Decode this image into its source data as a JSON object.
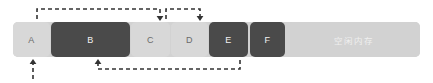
{
  "diagram": {
    "colors": {
      "bar_background": "#d2d2d2",
      "free_block": "#d2d2d2",
      "allocated_light": "#d8d8d8",
      "allocated_dark": "#4a4a4a",
      "arrow": "#333333",
      "page_background": "#ffffff",
      "label_on_light": "#6a6a6a",
      "label_on_dark": "#f2f2f2"
    },
    "bar": {
      "x": 13,
      "y": 22,
      "width": 407,
      "height": 35
    },
    "blocks": [
      {
        "label": "A",
        "x": 13,
        "width": 37,
        "style": "light",
        "name": "memory-block-a"
      },
      {
        "label": "B",
        "x": 51,
        "width": 79,
        "style": "dark",
        "name": "memory-block-b"
      },
      {
        "label": "C",
        "x": 131,
        "width": 39,
        "style": "light",
        "name": "memory-block-c"
      },
      {
        "label": "D",
        "x": 171,
        "width": 37,
        "style": "light",
        "name": "memory-block-d"
      },
      {
        "label": "E",
        "x": 209,
        "width": 39,
        "style": "dark",
        "name": "memory-block-e"
      },
      {
        "label": "F",
        "x": 250,
        "width": 35,
        "style": "dark",
        "name": "memory-block-f"
      },
      {
        "label": "空闲内存",
        "x": 287,
        "width": 133,
        "style": "free",
        "name": "memory-block-free"
      }
    ],
    "arrows": [
      {
        "name": "arrow-a-to-c",
        "path": "M 37 19 L 37 9 L 160 9 L 160 17",
        "head": {
          "x": 160,
          "y": 21,
          "dir": "down"
        }
      },
      {
        "name": "arrow-c-to-d",
        "path": "M 166 19 L 166 9 L 200 9 L 200 17",
        "head": {
          "x": 200,
          "y": 21,
          "dir": "down"
        }
      },
      {
        "name": "arrow-up-into-a",
        "path": "M 33 79 L 33 64",
        "head": {
          "x": 33,
          "y": 59,
          "dir": "up"
        }
      },
      {
        "name": "arrow-e-to-b",
        "path": "M 240 60 L 240 69 L 98 69 L 98 64",
        "head": {
          "x": 98,
          "y": 59,
          "dir": "up"
        }
      }
    ]
  }
}
